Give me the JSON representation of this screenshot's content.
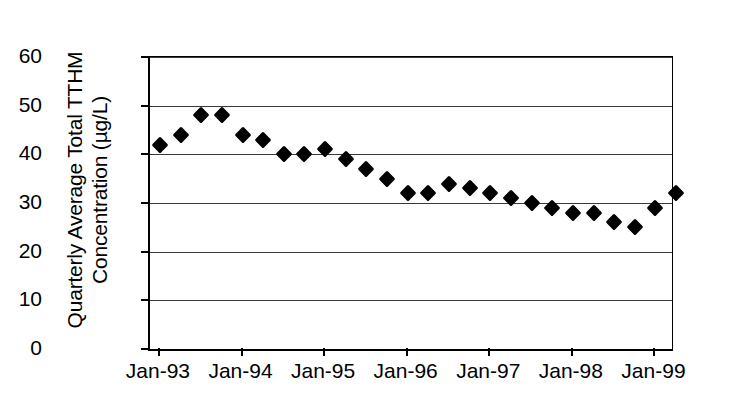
{
  "chart_data": {
    "type": "scatter",
    "title": "",
    "xlabel": "",
    "ylabel": "Quarterly Average Total TTHM Concentration (µg/L)",
    "ylabel_lines": [
      "Quarterly Average Total TTHM",
      "Concentration (µg/L)"
    ],
    "ylim": [
      0,
      60
    ],
    "ytick_labels": [
      "0",
      "10",
      "20",
      "30",
      "40",
      "50",
      "60"
    ],
    "ytick_values": [
      0,
      10,
      20,
      30,
      40,
      50,
      60
    ],
    "xtick_labels": [
      "Jan-93",
      "Jan-94",
      "Jan-95",
      "Jan-96",
      "Jan-97",
      "Jan-98",
      "Jan-99"
    ],
    "xtick_values": [
      1993.0,
      1994.0,
      1995.0,
      1996.0,
      1997.0,
      1998.0,
      1999.0
    ],
    "xlim": [
      1992.88,
      1999.2
    ],
    "grid": true,
    "grid_axis": "y",
    "legend": "none",
    "marker": "diamond",
    "marker_color": "#000000",
    "x": [
      1993.0,
      1993.25,
      1993.5,
      1993.75,
      1994.0,
      1994.25,
      1994.5,
      1994.75,
      1995.0,
      1995.25,
      1995.5,
      1995.75,
      1996.0,
      1996.25,
      1996.5,
      1996.75,
      1997.0,
      1997.25,
      1997.5,
      1997.75,
      1998.0,
      1998.25,
      1998.5,
      1998.75,
      1999.0
    ],
    "values": [
      42,
      44,
      48,
      48,
      44,
      43,
      40,
      40,
      41,
      39,
      37,
      35,
      32,
      32,
      34,
      33,
      32,
      31,
      30,
      29,
      28,
      28,
      26,
      25,
      29
    ],
    "extra_points": [
      {
        "x": 1999.25,
        "y": 32
      }
    ]
  }
}
